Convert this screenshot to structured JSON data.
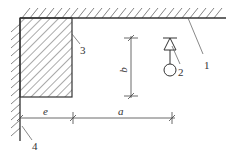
{
  "diagram": {
    "type": "engineering-schematic",
    "colors": {
      "line": "#333333",
      "hatch": "#555555",
      "background": "#ffffff"
    },
    "labels": {
      "ceiling_wall": "1",
      "symbol": "2",
      "block": "3",
      "side_wall": "4"
    },
    "dimensions": {
      "horizontal_left": "e",
      "horizontal_right": "a",
      "vertical": "b"
    }
  }
}
